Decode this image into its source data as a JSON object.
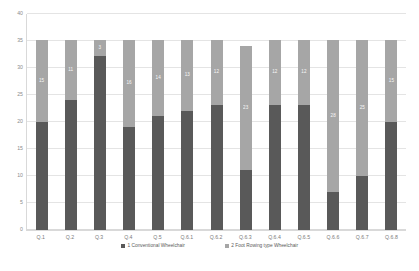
{
  "chart_data": {
    "type": "bar",
    "subtype": "stacked-column",
    "title": "",
    "xlabel": "",
    "ylabel": "",
    "ylim": [
      0,
      40
    ],
    "yticks": [
      0,
      5,
      10,
      15,
      20,
      25,
      30,
      35,
      40
    ],
    "grid": true,
    "legend_position": "bottom",
    "categories": [
      "Q.1",
      "Q.2",
      "Q.3",
      "Q.4",
      "Q.5",
      "Q.6.1",
      "Q.6.2",
      "Q.6.3",
      "Q.6.4",
      "Q.6.5",
      "Q.6.6",
      "Q.6.7",
      "Q.6.8"
    ],
    "series": [
      {
        "name": "1 Conventional Wheelchair",
        "color": "#595959",
        "values": [
          20,
          24,
          32,
          19,
          21,
          22,
          23,
          11,
          23,
          23,
          7,
          10,
          20
        ]
      },
      {
        "name": "2 Foot Rowing type Wheelchair",
        "color": "#a6a6a6",
        "values": [
          15,
          11,
          3,
          16,
          14,
          13,
          12,
          23,
          12,
          12,
          28,
          25,
          15
        ]
      }
    ],
    "totals": [
      35,
      35,
      35,
      35,
      35,
      35,
      35,
      34,
      35,
      35,
      35,
      35,
      35
    ],
    "data_labels_shown_series": "2 Foot Rowing type Wheelchair"
  },
  "axis": {
    "y_tick_labels": [
      "0",
      "5",
      "10",
      "15",
      "20",
      "25",
      "30",
      "35",
      "40"
    ],
    "x_tick_labels": [
      "Q.1",
      "Q.2",
      "Q.3",
      "Q.4",
      "Q.5",
      "Q.6.1",
      "Q.6.2",
      "Q.6.3",
      "Q.6.4",
      "Q.6.5",
      "Q.6.6",
      "Q.6.7",
      "Q.6.8"
    ]
  },
  "legend": {
    "items": [
      {
        "label": "1 Conventional Wheelchair",
        "color": "#595959"
      },
      {
        "label": "2 Foot Rowing type Wheelchair",
        "color": "#a6a6a6"
      }
    ]
  },
  "colors": {
    "series_1": "#595959",
    "series_2": "#a6a6a6",
    "gridline": "#e4e4e4",
    "axis_text": "#8c8c8c",
    "background": "#ffffff"
  }
}
